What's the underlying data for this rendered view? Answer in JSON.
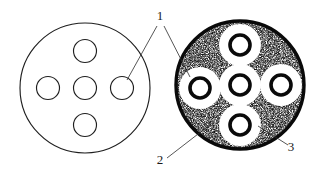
{
  "figure": {
    "background_color": "#ffffff",
    "line_color": "#1f1f1f",
    "stipple_color": "#111111",
    "halo_color": "#ffffff",
    "width": 325,
    "height": 175
  },
  "labels": [
    {
      "id": "label-1",
      "text": "1",
      "x": 160,
      "y": 20,
      "description": "callout pointing to hole in each cross-section"
    },
    {
      "id": "label-2",
      "text": "2",
      "x": 160,
      "y": 164,
      "description": "callout pointing to stippled matrix region"
    },
    {
      "id": "label-3",
      "text": "3",
      "x": 291,
      "y": 151,
      "description": "callout pointing to white halo zone around hole"
    }
  ],
  "left_view": {
    "name": "plain-cross-section",
    "center_x": 85,
    "center_y": 88,
    "radius": 65,
    "hole_radius": 11,
    "hole_offset": 37,
    "holes": [
      {
        "position": "center",
        "cx": 85,
        "cy": 88
      },
      {
        "position": "top",
        "cx": 85,
        "cy": 51
      },
      {
        "position": "bottom",
        "cx": 85,
        "cy": 125
      },
      {
        "position": "left",
        "cx": 48,
        "cy": 88
      },
      {
        "position": "right",
        "cx": 122,
        "cy": 88
      }
    ]
  },
  "right_view": {
    "name": "stippled-cross-section",
    "center_x": 240,
    "center_y": 85,
    "radius": 66,
    "rim_width": 3.2,
    "hole_radius": 10,
    "hole_ring_width": 3.4,
    "halo_radius": 20,
    "hole_offset": 38,
    "holes": [
      {
        "position": "center",
        "cx": 240,
        "cy": 85
      },
      {
        "position": "top",
        "cx": 240,
        "cy": 45
      },
      {
        "position": "bottom",
        "cx": 240,
        "cy": 125
      },
      {
        "position": "left",
        "cx": 200,
        "cy": 88
      },
      {
        "position": "right",
        "cx": 281,
        "cy": 85
      }
    ]
  },
  "leaders": [
    {
      "id": "leader-1-left",
      "from_x": 157,
      "from_y": 26,
      "to_x": 127,
      "to_y": 80,
      "target": "left-view-right-hole"
    },
    {
      "id": "leader-1-right",
      "from_x": 164,
      "from_y": 26,
      "to_x": 190,
      "to_y": 77,
      "target": "right-view-left-hole"
    },
    {
      "id": "leader-2",
      "from_x": 167,
      "from_y": 158,
      "to_x": 211,
      "to_y": 124,
      "target": "stipple-matrix"
    },
    {
      "id": "leader-3",
      "from_x": 288,
      "from_y": 145,
      "to_x": 258,
      "to_y": 126,
      "target": "white-halo"
    }
  ]
}
